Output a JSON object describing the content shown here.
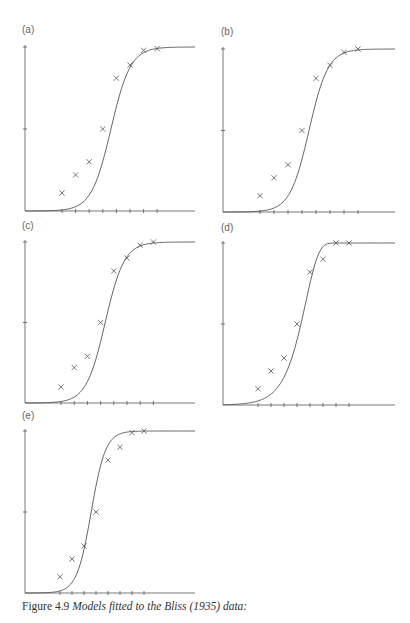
{
  "caption": {
    "prefix": "Figure 4.9",
    "text": "Models fitted to the Bliss (1935) data:"
  },
  "style": {
    "line_color": "#555555",
    "marker_color": "#555555"
  },
  "chart_data": [
    {
      "type": "line",
      "panel": "(a)",
      "title": "(a)",
      "xlabel": "",
      "ylabel": "",
      "x_ticks": 8,
      "y_ticks": [
        0,
        0.5,
        1
      ],
      "ylim": [
        0,
        1
      ],
      "observed": {
        "x": [
          1,
          2,
          3,
          4,
          5,
          6,
          7,
          8
        ],
        "y": [
          0.11,
          0.22,
          0.3,
          0.5,
          0.81,
          0.89,
          0.98,
          0.99
        ]
      },
      "fitted_model": "sigmoid",
      "curve": {
        "midpoint": 4.6,
        "scale": 0.72
      }
    },
    {
      "type": "line",
      "panel": "(b)",
      "title": "(b)",
      "xlabel": "",
      "ylabel": "",
      "x_ticks": 8,
      "y_ticks": [
        0,
        0.5,
        1
      ],
      "ylim": [
        0,
        1
      ],
      "observed": {
        "x": [
          1,
          2,
          3,
          4,
          5,
          6,
          7,
          8
        ],
        "y": [
          0.1,
          0.21,
          0.29,
          0.5,
          0.82,
          0.9,
          0.98,
          1.0
        ]
      },
      "fitted_model": "sigmoid",
      "curve": {
        "midpoint": 4.5,
        "scale": 0.68
      }
    },
    {
      "type": "line",
      "panel": "(c)",
      "title": "(c)",
      "xlabel": "",
      "ylabel": "",
      "x_ticks": 8,
      "y_ticks": [
        0,
        0.5,
        1
      ],
      "ylim": [
        0,
        1
      ],
      "observed": {
        "x": [
          1,
          2,
          3,
          4,
          5,
          6,
          7,
          8
        ],
        "y": [
          0.1,
          0.22,
          0.29,
          0.5,
          0.82,
          0.9,
          0.98,
          1.0
        ]
      },
      "fitted_model": "sigmoid",
      "curve": {
        "midpoint": 4.35,
        "scale": 0.72
      }
    },
    {
      "type": "line",
      "panel": "(d)",
      "title": "(d)",
      "xlabel": "",
      "ylabel": "",
      "x_ticks": 8,
      "y_ticks": [
        0,
        0.5,
        1
      ],
      "ylim": [
        0,
        1
      ],
      "observed": {
        "x": [
          1,
          2,
          3,
          4,
          5,
          6,
          7,
          8
        ],
        "y": [
          0.1,
          0.21,
          0.29,
          0.5,
          0.82,
          0.9,
          1.0,
          1.0
        ]
      },
      "fitted_model": "complementary log-log",
      "curve": {
        "midpoint": 4.3,
        "scale": 0.75
      }
    },
    {
      "type": "line",
      "panel": "(e)",
      "title": "(e)",
      "xlabel": "",
      "ylabel": "",
      "x_ticks": 8,
      "y_ticks": [
        0,
        0.5,
        1
      ],
      "ylim": [
        0,
        1
      ],
      "observed": {
        "x": [
          1,
          2,
          3,
          4,
          5,
          6,
          7,
          8
        ],
        "y": [
          0.1,
          0.21,
          0.29,
          0.5,
          0.82,
          0.9,
          0.99,
          1.0
        ]
      },
      "fitted_model": "sigmoid",
      "curve": {
        "midpoint": 3.6,
        "scale": 0.6
      }
    }
  ],
  "layout": [
    {
      "left": 0,
      "top": 0,
      "ax_x": 25,
      "ax_y0": 211,
      "ax_y1": 47,
      "ax_right": 195,
      "tick0": 62,
      "tick_step": 13.6,
      "label_x": 22,
      "label_y": 24
    },
    {
      "left": 205,
      "top": 0,
      "ax_x": 18,
      "ax_y0": 212,
      "ax_y1": 49,
      "ax_right": 190,
      "tick0": 55,
      "tick_step": 14.0,
      "label_x": 16,
      "label_y": 26
    },
    {
      "left": 0,
      "top": 220,
      "ax_x": 25,
      "ax_y0": 183,
      "ax_y1": 22,
      "ax_right": 195,
      "tick0": 61,
      "tick_step": 13.2,
      "label_x": 22,
      "label_y": 0
    },
    {
      "left": 205,
      "top": 220,
      "ax_x": 18,
      "ax_y0": 185,
      "ax_y1": 23,
      "ax_right": 190,
      "tick0": 53,
      "tick_step": 13.0,
      "label_x": 16,
      "label_y": 2
    },
    {
      "left": 0,
      "top": 410,
      "ax_x": 25,
      "ax_y0": 183,
      "ax_y1": 21,
      "ax_right": 195,
      "tick0": 60,
      "tick_step": 12.0,
      "label_x": 22,
      "label_y": 0
    }
  ]
}
